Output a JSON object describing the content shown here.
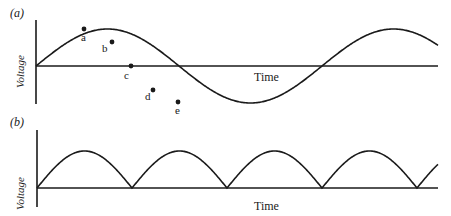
{
  "panels": [
    {
      "id": "a",
      "label": "(a)",
      "ylabel": "Voltage",
      "xlabel": "Time",
      "waveform": "sine",
      "points": [
        {
          "name": "a"
        },
        {
          "name": "b"
        },
        {
          "name": "c"
        },
        {
          "name": "d"
        },
        {
          "name": "e"
        }
      ]
    },
    {
      "id": "b",
      "label": "(b)",
      "ylabel": "Voltage",
      "xlabel": "Time",
      "waveform": "full-wave rectified sine"
    }
  ],
  "colors": {
    "line": "#1a1a1a",
    "background": "#ffffff"
  }
}
